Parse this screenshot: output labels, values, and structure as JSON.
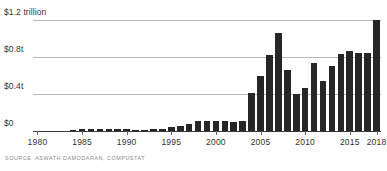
{
  "chart_data": {
    "type": "bar",
    "title": "",
    "xlabel": "",
    "ylabel": "",
    "ylim": [
      0,
      1.2
    ],
    "xlim": [
      1979.5,
      2018.5
    ],
    "grid": true,
    "legend": null,
    "y_ticks": [
      0,
      0.4,
      0.8,
      1.2
    ],
    "y_tick_labels": [
      "$0",
      "$0.4t",
      "$0.8t",
      "$1.2 trillion"
    ],
    "x_tick_labels": [
      "1980",
      "1985",
      "1990",
      "1995",
      "2000",
      "2005",
      "2010",
      "2015",
      "2018"
    ],
    "x_tick_values": [
      1980,
      1985,
      1990,
      1995,
      2000,
      2005,
      2010,
      2015,
      2018
    ],
    "bar_color": "#262626",
    "grid_color": "#b9b9b9",
    "axis_color": "#3a3a3a",
    "units": "trillions of US dollars",
    "categories": [
      "1980",
      "1981",
      "1982",
      "1983",
      "1984",
      "1985",
      "1986",
      "1987",
      "1988",
      "1989",
      "1990",
      "1991",
      "1992",
      "1993",
      "1994",
      "1995",
      "1996",
      "1997",
      "1998",
      "1999",
      "2000",
      "2001",
      "2002",
      "2003",
      "2004",
      "2005",
      "2006",
      "2007",
      "2008",
      "2009",
      "2010",
      "2011",
      "2012",
      "2013",
      "2014",
      "2015",
      "2016",
      "2017",
      "2018"
    ],
    "values": [
      0.0,
      0.0,
      0.0,
      0.0,
      0.015,
      0.022,
      0.024,
      0.025,
      0.025,
      0.024,
      0.018,
      0.008,
      0.012,
      0.018,
      0.026,
      0.038,
      0.052,
      0.075,
      0.105,
      0.112,
      0.112,
      0.108,
      0.098,
      0.105,
      0.415,
      0.6,
      0.82,
      1.055,
      0.66,
      0.405,
      0.46,
      0.73,
      0.545,
      0.7,
      0.835,
      0.87,
      0.84,
      0.84,
      1.2
    ]
  },
  "footer": {
    "source": "SOURCE: ASWATH DAMODARAN, COMPUSTAT"
  }
}
